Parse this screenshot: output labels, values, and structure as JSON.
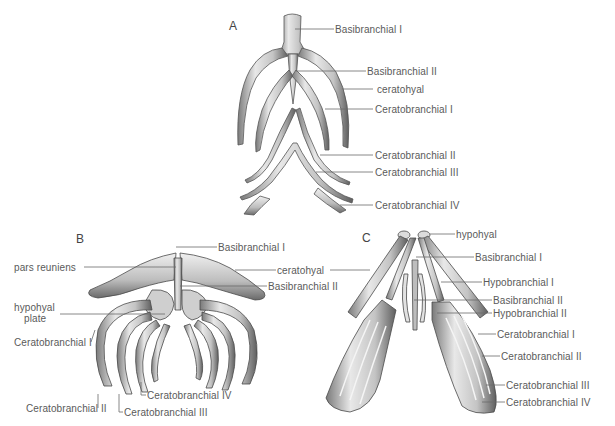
{
  "figure": {
    "panels": [
      {
        "id": "A",
        "letter": "A",
        "labels": [
          "Basibranchial I",
          "Basibranchial II",
          "ceratohyal",
          "Ceratobranchial I",
          "Ceratobranchial II",
          "Ceratobranchial III",
          "Ceratobranchial IV"
        ]
      },
      {
        "id": "B",
        "letter": "B",
        "labels": [
          "Basibranchial I",
          "pars reuniens",
          "ceratohyal",
          "Basibranchial II",
          "hypohyal",
          "plate",
          "Ceratobranchial I",
          "Ceratobranchial IV",
          "Ceratobranchial II",
          "Ceratobranchial III"
        ]
      },
      {
        "id": "C",
        "letter": "C",
        "labels": [
          "hypohyal",
          "Basibranchial I",
          "Hypobranchial I",
          "Basibranchial II",
          "Hypobranchial II",
          "Ceratobranchial I",
          "Ceratobranchial II",
          "Ceratobranchial III",
          "Ceratobranchial IV"
        ]
      }
    ],
    "colors": {
      "background": "#ffffff",
      "leader_line": "#6a6a6a",
      "bone_light": "#eeeeee",
      "bone_mid": "#b5b5b5",
      "bone_dark": "#5a5a5a"
    }
  }
}
